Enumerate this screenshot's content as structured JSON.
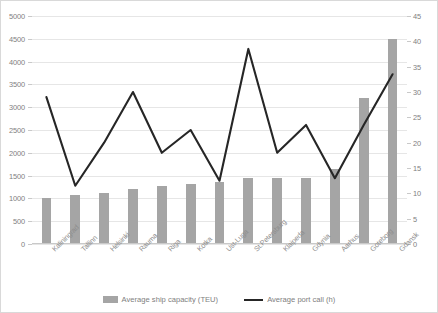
{
  "chart_data": {
    "type": "bar",
    "title": "",
    "subtitle": "",
    "xlabel": "",
    "ylabel": "",
    "categories": [
      "Kaliningrad",
      "Tallinn",
      "Helsinki",
      "Rauma",
      "Riga",
      "Kotka",
      "Ust-Luga",
      "St.Petersburg",
      "Klaipeda",
      "Gdynia",
      "Aarhus",
      "Goteborg",
      "Gdansk"
    ],
    "series": [
      {
        "name": "Average ship capacity (TEU)",
        "type": "bar",
        "axis": "left",
        "color": "#a5a5a5",
        "values": [
          1000,
          1080,
          1120,
          1200,
          1280,
          1320,
          1360,
          1450,
          1450,
          1450,
          1650,
          3200,
          4500
        ]
      },
      {
        "name": "Average port call (h)",
        "type": "line",
        "axis": "right",
        "color": "#262626",
        "values": [
          29,
          11.5,
          20,
          30,
          18,
          22.5,
          12.5,
          38.5,
          18,
          23.5,
          13,
          23.5,
          33.5
        ]
      }
    ],
    "ylim": [
      0,
      5000
    ],
    "ytick_step": 500,
    "yticks": [
      "0",
      "500",
      "1000",
      "1500",
      "2000",
      "2500",
      "3000",
      "3500",
      "4000",
      "4500",
      "5000"
    ],
    "y2lim": [
      0,
      45
    ],
    "y2tick_step": 5,
    "y2ticks": [
      "0",
      "5",
      "10",
      "15",
      "20",
      "25",
      "30",
      "35",
      "40",
      "45"
    ],
    "grid": true,
    "legend_position": "bottom",
    "legend": [
      {
        "label": "Average ship capacity (TEU)",
        "marker": "bar-swatch-icon",
        "color": "#a5a5a5"
      },
      {
        "label": "Average port call (h)",
        "marker": "line-swatch-icon",
        "color": "#262626"
      }
    ]
  }
}
